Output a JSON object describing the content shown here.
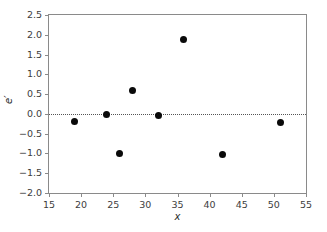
{
  "chart_data": {
    "type": "scatter",
    "title": "",
    "xlabel": "x",
    "ylabel": "e′",
    "xlim": [
      15,
      55
    ],
    "ylim": [
      -2.0,
      2.5
    ],
    "xticks": [
      15,
      20,
      25,
      30,
      35,
      40,
      45,
      50,
      55
    ],
    "xtick_labels": [
      "15",
      "20",
      "25",
      "30",
      "35",
      "40",
      "45",
      "50",
      "55"
    ],
    "yticks": [
      -2.0,
      -1.5,
      -1.0,
      -0.5,
      0.0,
      0.5,
      1.0,
      1.5,
      2.0,
      2.5
    ],
    "ytick_labels": [
      "−2.0",
      "−1.5",
      "−1.0",
      "−0.5",
      "0.0",
      "0.5",
      "1.0",
      "1.5",
      "2.0",
      "2.5"
    ],
    "grid": false,
    "legend": null,
    "reference_line": {
      "orientation": "horizontal",
      "y": 0.0,
      "style": "dotted"
    },
    "marker": {
      "shape": "circle",
      "color": "#0a0a0a",
      "size": 7
    },
    "x": [
      19,
      24,
      26,
      28,
      32,
      36,
      42,
      51
    ],
    "y": [
      -0.19,
      -0.02,
      -1.0,
      0.6,
      -0.03,
      1.88,
      -1.02,
      -0.23
    ],
    "points": [
      {
        "x": 19,
        "y": -0.19
      },
      {
        "x": 24,
        "y": -0.02
      },
      {
        "x": 26,
        "y": -1.0
      },
      {
        "x": 28,
        "y": 0.6
      },
      {
        "x": 32,
        "y": -0.03
      },
      {
        "x": 36,
        "y": 1.88
      },
      {
        "x": 42,
        "y": -1.02
      },
      {
        "x": 51,
        "y": -0.23
      }
    ]
  },
  "colors": {
    "axis": "#8a8a8a",
    "tick_text": "#3d3d3d",
    "marker": "#0a0a0a",
    "reference_line": "#555555",
    "background": "#ffffff"
  }
}
